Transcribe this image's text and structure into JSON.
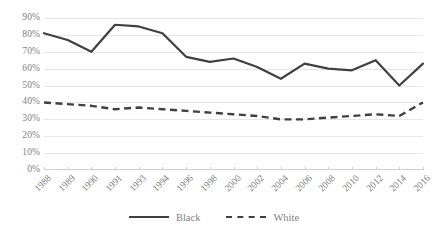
{
  "chart_data": {
    "type": "line",
    "title": "",
    "xlabel": "",
    "ylabel": "",
    "ylim": [
      0,
      90
    ],
    "ytick_labels": [
      "90%",
      "80%",
      "70%",
      "60%",
      "50%",
      "40%",
      "30%",
      "20%",
      "10%",
      "0%"
    ],
    "ytick_values": [
      90,
      80,
      70,
      60,
      50,
      40,
      30,
      20,
      10,
      0
    ],
    "grid": true,
    "legend_position": "bottom",
    "categories": [
      "1988",
      "1989",
      "1990",
      "1991",
      "1993",
      "1994",
      "1996",
      "1998",
      "2000",
      "2002",
      "2004",
      "2006",
      "2008",
      "2010",
      "2012",
      "2014",
      "2016"
    ],
    "series": [
      {
        "name": "Black",
        "style": "solid",
        "color": "#404040",
        "values": [
          81,
          77,
          70,
          86,
          85,
          81,
          67,
          64,
          66,
          61,
          54,
          63,
          60,
          59,
          65,
          50,
          63
        ]
      },
      {
        "name": "White",
        "style": "dashed",
        "color": "#404040",
        "values": [
          40,
          39,
          38,
          36,
          37,
          36,
          35,
          34,
          33,
          32,
          30,
          30,
          31,
          32,
          33,
          32,
          40
        ]
      }
    ]
  },
  "legend": {
    "items": [
      {
        "label": "Black",
        "style": "solid"
      },
      {
        "label": "White",
        "style": "dashed"
      }
    ]
  }
}
